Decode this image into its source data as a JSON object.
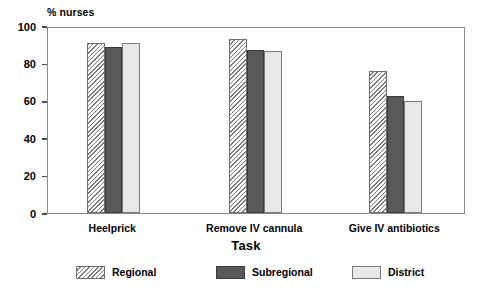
{
  "chart_data": {
    "type": "bar",
    "title": "",
    "xlabel": "Task",
    "ylabel": "% nurses",
    "ylim": [
      0,
      100
    ],
    "yticks": [
      0,
      20,
      40,
      60,
      80,
      100
    ],
    "ytick_labels": [
      "0",
      "20",
      "40",
      "60",
      "80",
      "100"
    ],
    "grid": false,
    "legend_position": "bottom",
    "categories": [
      "Heelprick",
      "Remove IV cannula",
      "Give IV antibiotics"
    ],
    "series": [
      {
        "name": "Regional",
        "values": [
          91,
          93,
          76
        ],
        "fill": "diagonal-hatch",
        "color": "#ffffff"
      },
      {
        "name": "Subregional",
        "values": [
          89,
          87,
          62.5
        ],
        "fill": "solid",
        "color": "#595959"
      },
      {
        "name": "District",
        "values": [
          91,
          86.5,
          60
        ],
        "fill": "solid",
        "color": "#e8e8e8"
      }
    ]
  },
  "axes": {
    "y_title": "% nurses",
    "x_title": "Task"
  },
  "legend": {
    "items": [
      {
        "label": "Regional"
      },
      {
        "label": "Subregional"
      },
      {
        "label": "District"
      }
    ]
  },
  "colors": {
    "frame": "#8a8a8a",
    "subregional": "#595959",
    "district": "#e8e8e8",
    "hatch": "#7d7d7d"
  }
}
